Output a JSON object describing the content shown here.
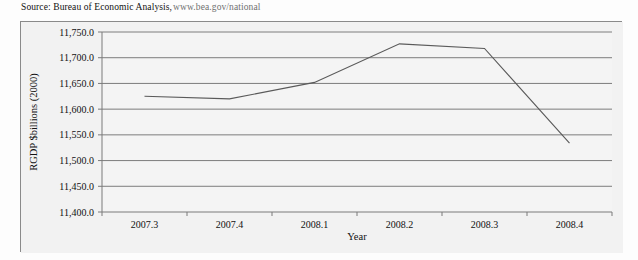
{
  "source": {
    "label": "Source: Bureau of Economic Analysis,",
    "url": "www.bea.gov/national"
  },
  "chart_data": {
    "type": "line",
    "title": "",
    "xlabel": "Year",
    "ylabel": "RGDP $billions (2000)",
    "categories": [
      "2007.3",
      "2007.4",
      "2008.1",
      "2008.2",
      "2008.3",
      "2008.4"
    ],
    "values": [
      11625.0,
      11620.0,
      11652.0,
      11727.0,
      11718.0,
      11534.0
    ],
    "series": [
      {
        "name": "RGDP",
        "values": [
          11625.0,
          11620.0,
          11652.0,
          11727.0,
          11718.0,
          11534.0
        ]
      }
    ],
    "ylim": [
      11400.0,
      11750.0
    ],
    "ytick_values": [
      11750.0,
      11700.0,
      11650.0,
      11600.0,
      11550.0,
      11500.0,
      11450.0,
      11400.0
    ],
    "ytick_labels": [
      "11,750.0",
      "11,700.0",
      "11,650.0",
      "11,600.0",
      "11,550.0",
      "11,500.0",
      "11,450.0",
      "11,400.0"
    ],
    "grid": true,
    "grid_axis": "y",
    "legend": "none",
    "line_color": "#5a5a5a",
    "plot_background": "#f4f4f4",
    "frame_background": "#f2f2f2",
    "axis_color": "#7a7a7a"
  }
}
